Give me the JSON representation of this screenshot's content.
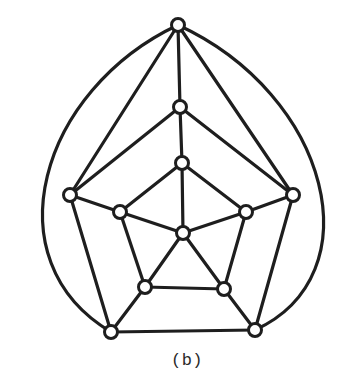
{
  "caption": "(b)",
  "colors": {
    "stroke": "#1e1e1e",
    "node_fill": "#ffffff",
    "background": "#ffffff"
  },
  "graph": {
    "nodes": [
      {
        "id": "T",
        "x": 178,
        "y": 25
      },
      {
        "id": "M1",
        "x": 180,
        "y": 107
      },
      {
        "id": "C1",
        "x": 182,
        "y": 163
      },
      {
        "id": "OL",
        "x": 70,
        "y": 195
      },
      {
        "id": "OR",
        "x": 293,
        "y": 195
      },
      {
        "id": "IL",
        "x": 120,
        "y": 212
      },
      {
        "id": "IR",
        "x": 246,
        "y": 212
      },
      {
        "id": "CTR",
        "x": 183,
        "y": 233
      },
      {
        "id": "LL",
        "x": 145,
        "y": 287
      },
      {
        "id": "LR",
        "x": 224,
        "y": 289
      },
      {
        "id": "BL",
        "x": 111,
        "y": 332
      },
      {
        "id": "BR",
        "x": 255,
        "y": 330
      }
    ],
    "edges": [
      [
        "T",
        "OL"
      ],
      [
        "T",
        "OR"
      ],
      [
        "T",
        "M1"
      ],
      [
        "M1",
        "OL"
      ],
      [
        "M1",
        "OR"
      ],
      [
        "M1",
        "C1"
      ],
      [
        "C1",
        "IL"
      ],
      [
        "C1",
        "IR"
      ],
      [
        "C1",
        "CTR"
      ],
      [
        "CTR",
        "IL"
      ],
      [
        "CTR",
        "IR"
      ],
      [
        "CTR",
        "LL"
      ],
      [
        "CTR",
        "LR"
      ],
      [
        "IL",
        "OL"
      ],
      [
        "IL",
        "LL"
      ],
      [
        "IR",
        "OR"
      ],
      [
        "IR",
        "LR"
      ],
      [
        "LL",
        "LR"
      ],
      [
        "LL",
        "BL"
      ],
      [
        "LR",
        "BR"
      ],
      [
        "OL",
        "BL"
      ],
      [
        "OR",
        "BR"
      ],
      [
        "BL",
        "BR"
      ]
    ],
    "arcs": [
      {
        "from": "T",
        "to": "BL",
        "path": "M178,25 C 40,90 -10,260 111,332"
      },
      {
        "from": "T",
        "to": "BR",
        "path": "M178,25 C 330,95 375,275 255,330"
      }
    ],
    "node_radius": 6.5
  }
}
